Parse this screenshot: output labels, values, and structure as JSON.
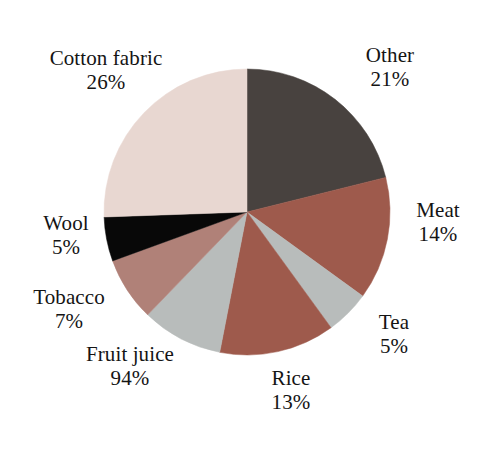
{
  "chart_data": {
    "type": "pie",
    "title": "",
    "subtitle": "",
    "xlabel": "",
    "ylabel": "",
    "legend_position": "none",
    "grid": false,
    "labels_printed_on_chart": true,
    "categories": [
      "Other",
      "Meat",
      "Tea",
      "Rice",
      "Fruit juice",
      "Tobacco",
      "Wool",
      "Cotton fabric"
    ],
    "values": [
      21,
      14,
      5,
      13,
      94,
      7,
      5,
      26
    ],
    "value_suffix": "%",
    "slices": [
      {
        "name": "Other",
        "value": 21,
        "value_label": "21%",
        "color": "#48423f",
        "start_angle_deg": 0,
        "end_angle_deg": 76,
        "label_name": "Other",
        "label_value": "21%"
      },
      {
        "name": "Meat",
        "value": 14,
        "value_label": "14%",
        "color": "#9e5a4c",
        "start_angle_deg": 76,
        "end_angle_deg": 126,
        "label_name": "Meat",
        "label_value": "14%"
      },
      {
        "name": "Tea",
        "value": 5,
        "value_label": "5%",
        "color": "#b8bcbb",
        "start_angle_deg": 126,
        "end_angle_deg": 144,
        "label_name": "Tea",
        "label_value": "5%"
      },
      {
        "name": "Rice",
        "value": 13,
        "value_label": "13%",
        "color": "#9e5a4c",
        "start_angle_deg": 144,
        "end_angle_deg": 191,
        "label_name": "Rice",
        "label_value": "13%"
      },
      {
        "name": "Fruit juice",
        "value": 94,
        "value_label": "94%",
        "color": "#b8bcbb",
        "start_angle_deg": 191,
        "end_angle_deg": 224,
        "label_name": "Fruit juice",
        "label_value": "94%"
      },
      {
        "name": "Tobacco",
        "value": 7,
        "value_label": "7%",
        "color": "#b08178",
        "start_angle_deg": 224,
        "end_angle_deg": 250,
        "label_name": "Tobacco",
        "label_value": "7%"
      },
      {
        "name": "Wool",
        "value": 5,
        "value_label": "5%",
        "color": "#080808",
        "start_angle_deg": 250,
        "end_angle_deg": 268,
        "label_name": "Wool",
        "label_value": "5%"
      },
      {
        "name": "Cotton fabric",
        "value": 26,
        "value_label": "26%",
        "color": "#e8d7d1",
        "start_angle_deg": 268,
        "end_angle_deg": 360,
        "label_name": "Cotton fabric",
        "label_value": "26%"
      }
    ],
    "colors": {
      "other": "#48423f",
      "meat": "#9e5a4c",
      "tea": "#b8bcbb",
      "rice": "#9e5a4c",
      "fruit_juice": "#b8bcbb",
      "tobacco": "#b08178",
      "wool": "#080808",
      "cotton_fabric": "#e8d7d1",
      "background": "#ffffff",
      "text": "#141414"
    },
    "geometry": {
      "center_x": 247,
      "center_y": 212,
      "radius": 143
    }
  }
}
